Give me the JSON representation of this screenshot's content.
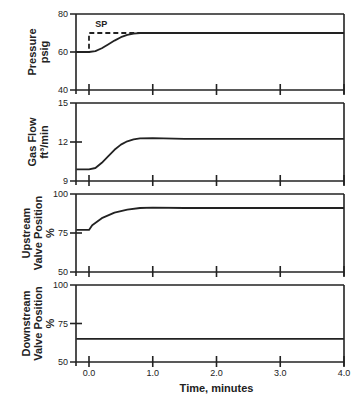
{
  "chart_data": {
    "type": "line",
    "layout": "4 stacked panels sharing x-axis",
    "xlabel": "Time, minutes",
    "x_ticks": [
      "0.0",
      "1.0",
      "2.0",
      "3.0",
      "4.0"
    ],
    "xlim": [
      -0.2,
      4.0
    ],
    "grid": false,
    "panels": [
      {
        "ylabel": [
          "Pressure",
          "psig"
        ],
        "y_ticks": [
          "80",
          "60",
          "40"
        ],
        "ylim": [
          40,
          80
        ],
        "annotation": "SP",
        "series": [
          {
            "name": "SP",
            "style": "dashed",
            "x": [
              -0.2,
              0.0,
              0.0,
              4.0
            ],
            "y": [
              60,
              60,
              70,
              70
            ]
          },
          {
            "name": "Pressure",
            "style": "solid",
            "x": [
              -0.2,
              0.0,
              0.1,
              0.2,
              0.3,
              0.4,
              0.5,
              0.6,
              0.7,
              0.8,
              1.0,
              4.0
            ],
            "y": [
              60,
              60,
              60.5,
              62,
              64,
              66,
              67.8,
              69,
              69.7,
              70,
              70,
              70
            ]
          }
        ]
      },
      {
        "ylabel": [
          "Gas Flow",
          "ft³/min"
        ],
        "y_ticks": [
          "15",
          "12",
          "9"
        ],
        "ylim": [
          9,
          15
        ],
        "series": [
          {
            "name": "Gas Flow",
            "style": "solid",
            "x": [
              -0.2,
              0.0,
              0.1,
              0.2,
              0.3,
              0.4,
              0.5,
              0.6,
              0.7,
              0.8,
              1.0,
              1.5,
              4.0
            ],
            "y": [
              9.9,
              9.9,
              10.0,
              10.4,
              10.9,
              11.4,
              11.8,
              12.05,
              12.2,
              12.28,
              12.3,
              12.25,
              12.25
            ]
          }
        ]
      },
      {
        "ylabel": [
          "Upstream",
          "Valve Position",
          "%"
        ],
        "y_ticks": [
          "100",
          "75",
          "50"
        ],
        "ylim": [
          50,
          100
        ],
        "series": [
          {
            "name": "Upstream Valve Position",
            "style": "solid",
            "x": [
              -0.2,
              0.0,
              0.05,
              0.2,
              0.4,
              0.6,
              0.8,
              1.0,
              1.5,
              4.0
            ],
            "y": [
              77,
              77,
              80,
              84.5,
              88,
              90,
              91,
              91.3,
              91,
              91
            ]
          }
        ]
      },
      {
        "ylabel": [
          "Downstream",
          "Valve Position",
          "%"
        ],
        "y_ticks": [
          "100",
          "75",
          "50"
        ],
        "ylim": [
          50,
          100
        ],
        "series": [
          {
            "name": "Downstream Valve Position",
            "style": "solid",
            "x": [
              -0.2,
              4.0
            ],
            "y": [
              65,
              65
            ]
          }
        ]
      }
    ]
  }
}
